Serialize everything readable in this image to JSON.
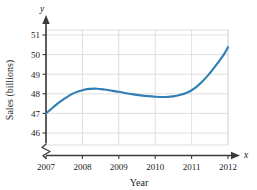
{
  "chart_data": {
    "type": "line",
    "title": "",
    "xlabel": "Year",
    "ylabel": "Sales (billions)",
    "x_axis_symbol": "x",
    "y_axis_symbol": "y",
    "xlim": [
      2007,
      2012
    ],
    "ylim": [
      45.7,
      51.3
    ],
    "xticks": [
      2007,
      2008,
      2009,
      2010,
      2011,
      2012
    ],
    "xtick_labels": [
      "2007",
      "2008",
      "2009",
      "2010",
      "2011",
      "2012"
    ],
    "yticks": [
      46,
      47,
      48,
      49,
      50,
      51
    ],
    "ytick_labels": [
      "46",
      "47",
      "48",
      "49",
      "50",
      "51"
    ],
    "grid": true,
    "legend": null,
    "y_axis_break": true,
    "series": [
      {
        "name": "Sales",
        "color": "#2f7fb5",
        "x": [
          2007.0,
          2007.15,
          2007.3,
          2007.45,
          2007.6,
          2007.75,
          2007.9,
          2008.05,
          2008.2,
          2008.4,
          2008.6,
          2008.8,
          2009.0,
          2009.2,
          2009.4,
          2009.6,
          2009.8,
          2010.0,
          2010.15,
          2010.3,
          2010.5,
          2010.7,
          2010.85,
          2011.0,
          2011.15,
          2011.3,
          2011.45,
          2011.6,
          2011.75,
          2011.9,
          2012.0
        ],
        "y": [
          47.0,
          47.24,
          47.47,
          47.68,
          47.86,
          48.02,
          48.13,
          48.21,
          48.25,
          48.26,
          48.22,
          48.16,
          48.1,
          48.03,
          47.97,
          47.92,
          47.88,
          47.85,
          47.84,
          47.84,
          47.87,
          47.95,
          48.04,
          48.18,
          48.38,
          48.64,
          48.94,
          49.28,
          49.65,
          50.05,
          50.38
        ]
      }
    ]
  },
  "figure": {
    "x_axis_symbol": "x",
    "y_axis_symbol": "y",
    "xlabel": "Year",
    "ylabel": "Sales (billions)",
    "curve_color": "#2f7fb5",
    "grid_color": "#d8d8d8",
    "axis_color": "#3a3a3a"
  }
}
